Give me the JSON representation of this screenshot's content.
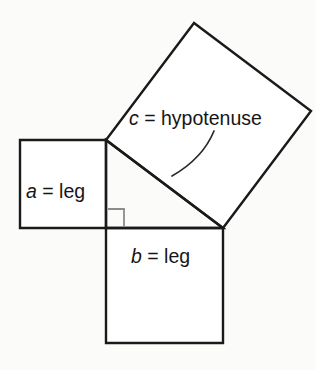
{
  "diagram": {
    "background_color": "#fbfbfa",
    "stroke_color": "#1a1a1a",
    "right_angle_color": "#8c8c8c",
    "labels": {
      "leg_a": {
        "variable": "a",
        "separator": " = ",
        "word": "leg",
        "full": "a = leg"
      },
      "leg_b": {
        "variable": "b",
        "separator": " = ",
        "word": "leg",
        "full": "b = leg"
      },
      "hypotenuse_c": {
        "variable": "c",
        "separator": " = ",
        "word": "hypotenuse",
        "full": "c = hypotenuse"
      }
    },
    "geometry": {
      "triangle_vertices": "106,140 106,228 223,228",
      "square_a_points": "20,140 106,140 106,228 20,228",
      "square_b_points": "106,228 223,228 223,343 106,343",
      "square_c_points": "106,140 223,228 311,111 194,23",
      "right_angle_mark_points": "108,209 124,209 124,227",
      "pointer_arc_path": "M 214,131 C 207,148 193,164 172,176"
    }
  }
}
